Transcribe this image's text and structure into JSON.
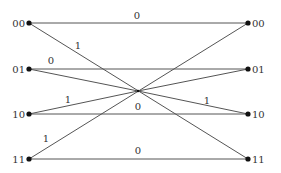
{
  "diagram": {
    "type": "trellis",
    "left_states": [
      {
        "label": "00",
        "x": 29,
        "y": 23
      },
      {
        "label": "01",
        "x": 29,
        "y": 69
      },
      {
        "label": "10",
        "x": 29,
        "y": 114
      },
      {
        "label": "11",
        "x": 29,
        "y": 159
      }
    ],
    "right_states": [
      {
        "label": "00",
        "x": 248,
        "y": 23
      },
      {
        "label": "01",
        "x": 248,
        "y": 69
      },
      {
        "label": "10",
        "x": 248,
        "y": 114
      },
      {
        "label": "11",
        "x": 248,
        "y": 159
      }
    ],
    "center": {
      "x": 138,
      "y": 91
    },
    "edges": [
      {
        "from": "00",
        "to": "00",
        "label": "0",
        "label_x": 137,
        "label_y": 19
      },
      {
        "from": "00",
        "to": "11",
        "label": "1",
        "label_x": 78,
        "label_y": 49
      },
      {
        "from": "01",
        "to": "01",
        "label": "0",
        "label_x": 51,
        "label_y": 64
      },
      {
        "from": "01",
        "to": "center",
        "label": "",
        "label_x": 0,
        "label_y": 0
      },
      {
        "from": "10",
        "to": "center",
        "label": "1",
        "label_x": 68,
        "label_y": 103
      },
      {
        "from": "10",
        "to": "10",
        "label": "0",
        "label_x": 138,
        "label_y": 110
      },
      {
        "from": "center",
        "to": "10",
        "label": "1",
        "label_x": 207,
        "label_y": 104
      },
      {
        "from": "11",
        "to": "00",
        "label": "1",
        "label_x": 46,
        "label_y": 142
      },
      {
        "from": "11",
        "to": "11",
        "label": "0",
        "label_x": 138,
        "label_y": 154
      },
      {
        "from": "center",
        "to": "01",
        "label": "",
        "label_x": 0,
        "label_y": 0
      }
    ],
    "edge_labels": [
      "0",
      "1",
      "0",
      "1",
      "0",
      "1",
      "1",
      "0"
    ],
    "colors": {
      "edge": "#555555",
      "node": "#111111",
      "text": "#333333"
    }
  }
}
